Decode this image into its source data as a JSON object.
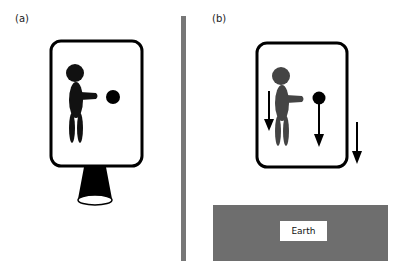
{
  "panels": [
    {
      "id": "a",
      "label": "(a)",
      "scene": "elevator box accelerating upward in space, propelled by rocket"
    },
    {
      "id": "b",
      "label": "(b)",
      "scene": "elevator box falling freely toward Earth"
    }
  ],
  "earth": {
    "label": "Earth"
  },
  "colors": {
    "ink": "#000000",
    "figure_a": "#111111",
    "figure_b": "#444444",
    "divider": "#777777",
    "earth": "#6e6e6e",
    "background": "#ffffff"
  }
}
